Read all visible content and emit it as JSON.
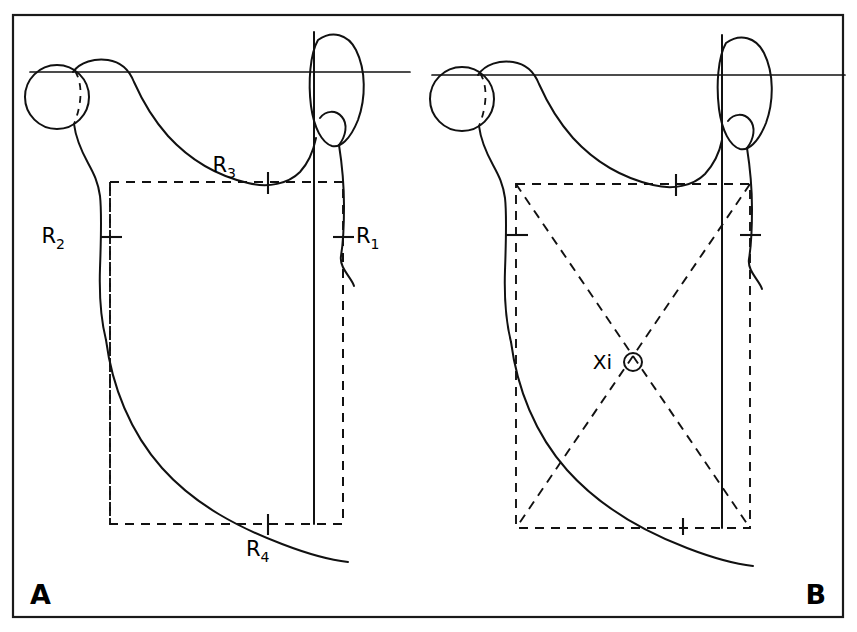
{
  "figure": {
    "background_color": "#ffffff",
    "line_color": "#111111",
    "frame": {
      "x": 13,
      "y": 15,
      "width": 830,
      "height": 602
    }
  },
  "panels": [
    {
      "id": "panel-a",
      "letter": "A",
      "letter_position": {
        "x": 30,
        "y": 604
      },
      "description": "Hip outline with horizontal reference line, dashed rectangle and four reference points"
    },
    {
      "id": "panel-b",
      "letter": "B",
      "letter_position": {
        "x": 826,
        "y": 604
      },
      "description": "Same hip outline with dashed rectangle diagonals intersecting at the centre point Xi"
    }
  ],
  "labels": {
    "r1": {
      "base": "R",
      "sub": "1",
      "x": 355,
      "y": 243
    },
    "r2": {
      "base": "R",
      "sub": "2",
      "x": 65,
      "y": 243
    },
    "r3": {
      "base": "R",
      "sub": "3",
      "x": 236,
      "y": 172
    },
    "r4": {
      "base": "R",
      "sub": "4",
      "x": 246,
      "y": 556
    },
    "xi": {
      "text": "Xi",
      "x": 588,
      "y": 366
    }
  },
  "geometry": {
    "panel_a": {
      "hilgenreiner_line": {
        "x1": 30,
        "y1": 72,
        "x2": 410,
        "y2": 72
      },
      "femoral_head_circle": {
        "cx": 57,
        "cy": 97,
        "r": 32
      },
      "vertical_reference_line": {
        "x": 314,
        "y1": 32,
        "y2": 524
      },
      "dashed_rectangle": {
        "x1": 110,
        "y1": 182,
        "x2": 343,
        "y2": 524
      },
      "tick_points": [
        {
          "name": "R3",
          "x": 268,
          "y": 182,
          "orientation": "vertical"
        },
        {
          "name": "R2",
          "x": 110,
          "y": 237,
          "orientation": "horizontal"
        },
        {
          "name": "R1",
          "x": 343,
          "y": 237,
          "orientation": "horizontal"
        },
        {
          "name": "R4",
          "x": 268,
          "y": 524,
          "orientation": "vertical"
        }
      ]
    },
    "panel_b": {
      "hilgenreiner_line": {
        "x1": 432,
        "y1": 75,
        "x2": 845,
        "y2": 75
      },
      "femoral_head_circle": {
        "cx": 462,
        "cy": 99,
        "r": 32
      },
      "vertical_reference_line": {
        "x": 722,
        "y1": 35,
        "y2": 528
      },
      "dashed_rectangle": {
        "x1": 516,
        "y1": 184,
        "x2": 750,
        "y2": 528
      },
      "diagonals": [
        {
          "x1": 516,
          "y1": 184,
          "x2": 750,
          "y2": 528
        },
        {
          "x1": 750,
          "y1": 184,
          "x2": 516,
          "y2": 528
        }
      ],
      "center_marker": {
        "cx": 633,
        "cy": 362,
        "r": 9
      },
      "tick_points": [
        {
          "name": "top",
          "x": 676,
          "y": 184,
          "orientation": "vertical"
        },
        {
          "name": "left",
          "x": 516,
          "y": 235,
          "orientation": "horizontal"
        },
        {
          "name": "right",
          "x": 750,
          "y": 235,
          "orientation": "horizontal"
        },
        {
          "name": "bottom",
          "x": 683,
          "y": 528,
          "orientation": "vertical"
        }
      ]
    }
  }
}
